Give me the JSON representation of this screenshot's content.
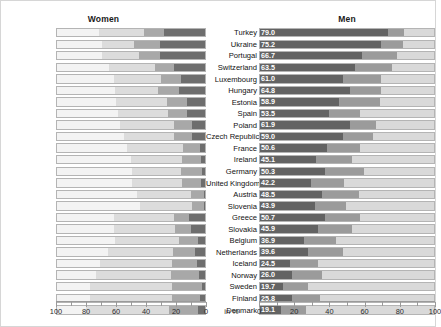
{
  "headers": {
    "women": "Women",
    "men": "Men"
  },
  "axis": {
    "unit_label": "in %",
    "ticks": [
      0,
      10,
      20,
      30,
      40,
      50,
      60,
      70,
      80,
      90,
      100
    ],
    "major_ticks": [
      0,
      20,
      40,
      60,
      80,
      100
    ],
    "women_tick_labels": [
      "100",
      "80",
      "60",
      "40",
      "20",
      "0"
    ],
    "men_tick_labels": [
      "0",
      "20",
      "40",
      "60",
      "80",
      "100"
    ],
    "women_direction": "reversed",
    "men_direction": "normal",
    "range": [
      0,
      100
    ]
  },
  "colors": {
    "segment_dark": "#6e6e6e",
    "segment_mid": "#a8a8a8",
    "segment_light": "#dcdcdc",
    "segment_men_dark": "#636363",
    "segment_men_mid": "#9b9b9b",
    "segment_men_light": "#d9d9d9",
    "track_bg": "#f3f3f3",
    "track_border": "#b4b4b4",
    "value_text": "#ffffff",
    "page_bg": "#ffffff",
    "frame_border": "#d6d6d6"
  },
  "chart_data": {
    "type": "bar",
    "title": "",
    "subtitle": "",
    "xlabel": "in %",
    "ylabel": "",
    "xlim": [
      0,
      100
    ],
    "grid": false,
    "legend_position": "none",
    "orientation": "horizontal",
    "layout": "back-to-back stacked bars (women left, men right)",
    "categories": [
      "Turkey",
      "Ukraine",
      "Portugal",
      "Switzerland",
      "Luxembourg",
      "Hungary",
      "Estonia",
      "Spain",
      "Poland",
      "Czech Republic",
      "France",
      "Ireland",
      "Germany",
      "United Kingdom",
      "Austria",
      "Slovenia",
      "Greece",
      "Slovakia",
      "Belgium",
      "Netherlands",
      "Iceland",
      "Norway",
      "Sweden",
      "Finland",
      "Denmark"
    ],
    "series": [
      {
        "name": "Women",
        "values": [
          70.8,
          69.0,
          68.6,
          63.7,
          60.5,
          60.3,
          59.4,
          58.1,
          56.6,
          54.1,
          52.0,
          49.2,
          48.7,
          48.4,
          45.6,
          43.6,
          39.5,
          39.3,
          38.2,
          35.4,
          30.1,
          27.2,
          23.5,
          23.2,
          20.4
        ]
      },
      {
        "name": "Men",
        "values": [
          79.0,
          75.2,
          66.7,
          63.5,
          61.0,
          64.8,
          58.9,
          53.5,
          61.9,
          59.0,
          50.6,
          45.1,
          50.3,
          42.2,
          48.5,
          43.9,
          50.7,
          45.9,
          36.9,
          39.6,
          24.5,
          26.0,
          19.7,
          25.8,
          19.1
        ]
      }
    ],
    "women_segments": [
      [
        29.8,
        13.5,
        27.5
      ],
      [
        21.4,
        17.3,
        30.3
      ],
      [
        24.5,
        13.8,
        30.3
      ],
      [
        30.6,
        12.6,
        20.5
      ],
      [
        31.0,
        13.2,
        16.3
      ],
      [
        29.2,
        13.5,
        17.6
      ],
      [
        33.8,
        13.9,
        11.7
      ],
      [
        33.4,
        12.8,
        11.9
      ],
      [
        35.7,
        12.1,
        8.8
      ],
      [
        33.4,
        12.1,
        8.6
      ],
      [
        37.4,
        11.5,
        3.1
      ],
      [
        33.8,
        12.8,
        2.6
      ],
      [
        32.7,
        14.1,
        1.9
      ],
      [
        32.9,
        13.1,
        2.4
      ],
      [
        36.2,
        8.4,
        1.0
      ],
      [
        34.8,
        8.1,
        0.7
      ],
      [
        40.1,
        9.8,
        10.6
      ],
      [
        41.0,
        10.3,
        9.4
      ],
      [
        42.5,
        12.4,
        5.0
      ],
      [
        43.5,
        14.6,
        6.5
      ],
      [
        48.0,
        16.5,
        5.4
      ],
      [
        50.2,
        18.6,
        4.0
      ],
      [
        54.8,
        19.7,
        2.0
      ],
      [
        55.0,
        18.3,
        3.5
      ],
      [
        55.7,
        19.2,
        4.7
      ]
    ],
    "men_segments": [
      [
        73.0,
        9.0,
        18.0
      ],
      [
        69.0,
        12.0,
        19.0
      ],
      [
        58.0,
        20.0,
        22.0
      ],
      [
        54.0,
        21.0,
        25.0
      ],
      [
        47.0,
        22.0,
        31.0
      ],
      [
        51.0,
        18.0,
        31.0
      ],
      [
        45.0,
        23.0,
        32.0
      ],
      [
        39.0,
        18.0,
        43.0
      ],
      [
        51.0,
        15.0,
        34.0
      ],
      [
        47.0,
        17.0,
        36.0
      ],
      [
        38.0,
        19.0,
        43.0
      ],
      [
        32.0,
        20.0,
        48.0
      ],
      [
        37.0,
        22.0,
        41.0
      ],
      [
        29.0,
        19.0,
        52.0
      ],
      [
        35.0,
        21.0,
        44.0
      ],
      [
        31.0,
        18.0,
        51.0
      ],
      [
        37.0,
        20.0,
        43.0
      ],
      [
        33.0,
        19.0,
        48.0
      ],
      [
        25.0,
        18.0,
        57.0
      ],
      [
        27.0,
        20.0,
        53.0
      ],
      [
        17.0,
        16.0,
        67.0
      ],
      [
        18.0,
        17.0,
        65.0
      ],
      [
        13.0,
        14.0,
        73.0
      ],
      [
        18.0,
        16.0,
        66.0
      ],
      [
        12.0,
        14.0,
        74.0
      ]
    ]
  }
}
